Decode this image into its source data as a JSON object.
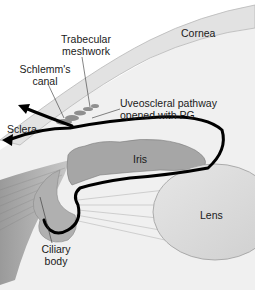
{
  "diagram": {
    "labels": {
      "cornea": "Cornea",
      "trabecular_line1": "Trabecular",
      "trabecular_line2": "meshwork",
      "schlemm_line1": "Schlemm's",
      "schlemm_line2": "canal",
      "uveoscleral_line1": "Uveoscleral pathway",
      "uveoscleral_line2": "opened with PG",
      "sclera": "Sclera",
      "iris": "Iris",
      "lens": "Lens",
      "ciliary_line1": "Ciliary",
      "ciliary_line2": "body"
    },
    "colors": {
      "background": "#ffffff",
      "cornea_fill": "#e8e8e8",
      "chamber_fill": "#ededed",
      "iris_fill": "#a8a8a8",
      "ciliary_fill": "#b5b5b5",
      "sclera_fill": "#c4c4c4",
      "lens_fill": "#dcdcdc",
      "pathway_stroke": "#000000",
      "label_text": "#1a1a1a"
    }
  }
}
